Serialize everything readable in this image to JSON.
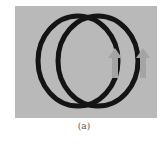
{
  "figure": {
    "caption": "(a)",
    "background_color": "#b9b9b9",
    "ring_color": "#141414",
    "arrow_color": "#a4a4a4",
    "rings": [
      {
        "name": "left-ring",
        "cx": 64,
        "cy": 53
      },
      {
        "name": "right-ring",
        "cx": 85,
        "cy": 53
      }
    ],
    "arrows": [
      {
        "name": "inner-arrow",
        "direction": "up"
      },
      {
        "name": "outer-arrow",
        "direction": "up"
      }
    ]
  }
}
